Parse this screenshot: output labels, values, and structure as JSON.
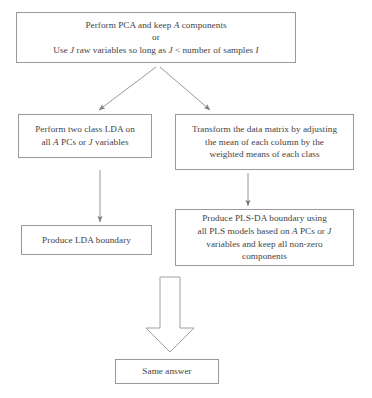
{
  "diagram": {
    "type": "flowchart",
    "background_color": "#ffffff",
    "box_border_color": "#9a9a9a",
    "text_color": "#444244",
    "arrow_color": "#8a8a8a",
    "nodes": [
      {
        "id": "start",
        "label": "Perform PCA and keep A components\nor\nUse J raw variables so long as J < number of samples I",
        "line1": "Perform PCA and keep A components",
        "line2": "or",
        "line3": "Use J raw variables so long as J < number of samples I"
      },
      {
        "id": "lda",
        "label": "Perform two class LDA on\nall A PCs or J variables"
      },
      {
        "id": "transform",
        "label": "Transform the data matrix by adjusting\nthe mean of each column by the\nweighted means of each class"
      },
      {
        "id": "lda-boundary",
        "label": "Produce LDA boundary"
      },
      {
        "id": "plsda-boundary",
        "label": "Produce PLS-DA boundary using\nall PLS models based on A PCs or J\nvariables and keep all non-zero\ncomponents"
      },
      {
        "id": "same-answer",
        "label": "Same answer"
      }
    ],
    "edges": [
      {
        "id": "start-to-lda",
        "from": "start",
        "to": "lda",
        "style": "thin-arrow-diagonal"
      },
      {
        "id": "start-to-transform",
        "from": "start",
        "to": "transform",
        "style": "thin-arrow-diagonal"
      },
      {
        "id": "lda-to-boundary",
        "from": "lda",
        "to": "lda-boundary",
        "style": "thin-arrow-vertical"
      },
      {
        "id": "transform-to-plsda",
        "from": "transform",
        "to": "plsda-boundary",
        "style": "thin-arrow-vertical"
      },
      {
        "id": "plsda-to-same",
        "from": "plsda-boundary",
        "to": "same-answer",
        "style": "block-arrow-down"
      }
    ]
  }
}
